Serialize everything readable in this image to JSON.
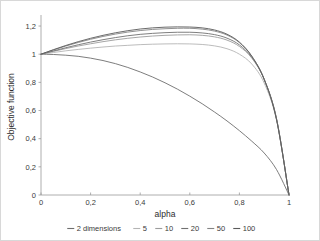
{
  "chart_data": {
    "type": "line",
    "title": "",
    "xlabel": "alpha",
    "ylabel": "Objective function",
    "xlim": [
      0,
      1
    ],
    "ylim": [
      0,
      1.25
    ],
    "grid": false,
    "legend_position": "bottom",
    "x_tick_labels": [
      "0",
      "0,2",
      "0,4",
      "0,6",
      "0,8",
      "1"
    ],
    "x_tick_values": [
      0,
      0.2,
      0.4,
      0.6,
      0.8,
      1
    ],
    "y_tick_labels": [
      "0",
      "0,2",
      "0,4",
      "0,6",
      "0,8",
      "1",
      "1,2"
    ],
    "y_tick_values": [
      0,
      0.2,
      0.4,
      0.6,
      0.8,
      1,
      1.2
    ],
    "x": [
      0,
      0.05,
      0.1,
      0.15,
      0.2,
      0.25,
      0.3,
      0.35,
      0.4,
      0.45,
      0.5,
      0.55,
      0.6,
      0.65,
      0.7,
      0.75,
      0.8,
      0.85,
      0.9,
      0.95,
      1
    ],
    "series": [
      {
        "name": "2 dimensions",
        "color": "#6e6e6e",
        "values": [
          1.0,
          0.998,
          0.993,
          0.985,
          0.972,
          0.955,
          0.933,
          0.906,
          0.874,
          0.838,
          0.797,
          0.752,
          0.702,
          0.648,
          0.589,
          0.526,
          0.457,
          0.382,
          0.298,
          0.18,
          0.0
        ]
      },
      {
        "name": "5",
        "color": "#b4b4b4",
        "values": [
          1.0,
          1.012,
          1.024,
          1.034,
          1.043,
          1.051,
          1.058,
          1.063,
          1.068,
          1.071,
          1.073,
          1.074,
          1.073,
          1.069,
          1.059,
          1.039,
          1.0,
          0.93,
          0.795,
          0.53,
          0.0
        ]
      },
      {
        "name": "10",
        "color": "#9c9c9c",
        "values": [
          1.0,
          1.02,
          1.04,
          1.058,
          1.074,
          1.089,
          1.102,
          1.113,
          1.122,
          1.129,
          1.134,
          1.137,
          1.138,
          1.134,
          1.123,
          1.1,
          1.055,
          0.972,
          0.82,
          0.54,
          0.0
        ]
      },
      {
        "name": "20",
        "color": "#707070",
        "values": [
          1.0,
          1.023,
          1.046,
          1.067,
          1.086,
          1.103,
          1.118,
          1.131,
          1.141,
          1.148,
          1.153,
          1.156,
          1.156,
          1.151,
          1.139,
          1.114,
          1.066,
          0.978,
          0.822,
          0.54,
          0.0
        ]
      },
      {
        "name": "50",
        "color": "#848484",
        "values": [
          1.0,
          1.03,
          1.058,
          1.083,
          1.106,
          1.126,
          1.143,
          1.157,
          1.168,
          1.176,
          1.181,
          1.184,
          1.184,
          1.178,
          1.164,
          1.136,
          1.082,
          0.985,
          0.822,
          0.535,
          0.0
        ]
      },
      {
        "name": "100",
        "color": "#5a5a5a",
        "values": [
          1.0,
          1.032,
          1.062,
          1.089,
          1.113,
          1.134,
          1.152,
          1.167,
          1.179,
          1.187,
          1.192,
          1.194,
          1.193,
          1.187,
          1.172,
          1.142,
          1.086,
          0.986,
          0.821,
          0.533,
          0.0
        ]
      }
    ]
  },
  "axes": {
    "x_title": "alpha",
    "y_title": "Objective function"
  },
  "legend": {
    "items": [
      {
        "label": "2 dimensions",
        "color": "#6e6e6e"
      },
      {
        "label": "5",
        "color": "#b4b4b4"
      },
      {
        "label": "10",
        "color": "#9c9c9c"
      },
      {
        "label": "20",
        "color": "#707070"
      },
      {
        "label": "50",
        "color": "#848484"
      },
      {
        "label": "100",
        "color": "#5a5a5a"
      }
    ]
  }
}
